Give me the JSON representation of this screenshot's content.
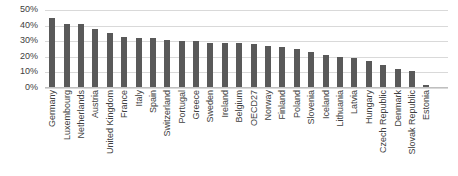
{
  "chart_data": {
    "type": "bar",
    "title": "",
    "xlabel": "",
    "ylabel": "",
    "ylim": [
      0,
      50
    ],
    "grid": true,
    "legend": null,
    "orientation": "vertical",
    "bar_color": "#595959",
    "gridline_color": "#d9d9d9",
    "tick_format": "percent",
    "yticks": [
      "0%",
      "10%",
      "20%",
      "30%",
      "40%",
      "50%"
    ],
    "ytick_values": [
      0,
      10,
      20,
      30,
      40,
      50
    ],
    "categories": [
      "Germany",
      "Luxembourg",
      "Netherlands",
      "Austria",
      "United Kingdom",
      "France",
      "Italy",
      "Spain",
      "Switzerland",
      "Portugal",
      "Greece",
      "Sweden",
      "Ireland",
      "Belgium",
      "OECD27",
      "Norway",
      "Finland",
      "Poland",
      "Slovenia",
      "Iceland",
      "Lithuania",
      "Latvia",
      "Hungary",
      "Czech Republic",
      "Denmark",
      "Slovak Republic",
      "Estonia"
    ],
    "values": [
      45,
      41,
      41,
      38,
      35,
      33,
      32,
      32,
      31,
      30,
      30,
      29,
      29,
      29,
      28,
      27,
      26,
      25,
      23,
      21,
      20,
      19,
      17,
      15,
      12,
      11,
      2
    ]
  }
}
